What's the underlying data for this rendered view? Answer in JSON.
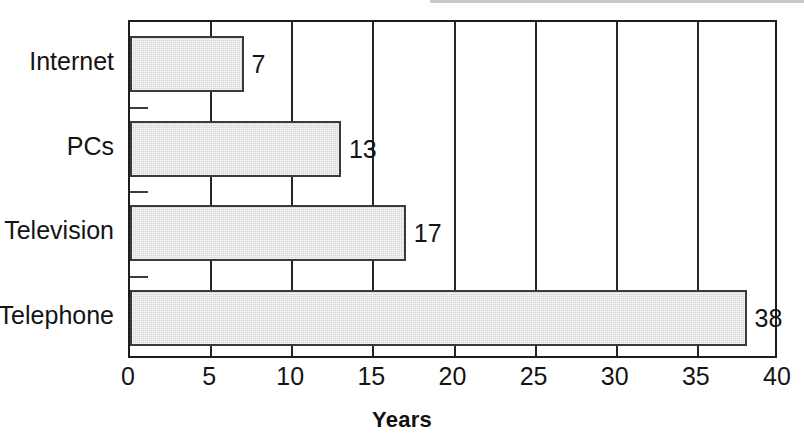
{
  "chart_data": {
    "type": "bar",
    "orientation": "horizontal",
    "title": "",
    "subtitle": "",
    "xlabel": "Years",
    "ylabel": "",
    "categories": [
      "Internet",
      "PCs",
      "Television",
      "Telephone"
    ],
    "values": [
      7,
      13,
      17,
      38
    ],
    "value_labels": [
      "7",
      "13",
      "17",
      "38"
    ],
    "xlim": [
      0,
      40
    ],
    "xticks": [
      0,
      5,
      10,
      15,
      20,
      25,
      30,
      35,
      40
    ],
    "xtick_labels": [
      "0",
      "5",
      "10",
      "15",
      "20",
      "25",
      "30",
      "35",
      "40"
    ],
    "grid": "vertical",
    "legend": null,
    "bar_fill": "#d6d6d6",
    "bar_border": "#3a3a3a",
    "axis_color": "#1d1d1d",
    "text_color": "#141414"
  },
  "axis": {
    "x_title": "Years"
  }
}
